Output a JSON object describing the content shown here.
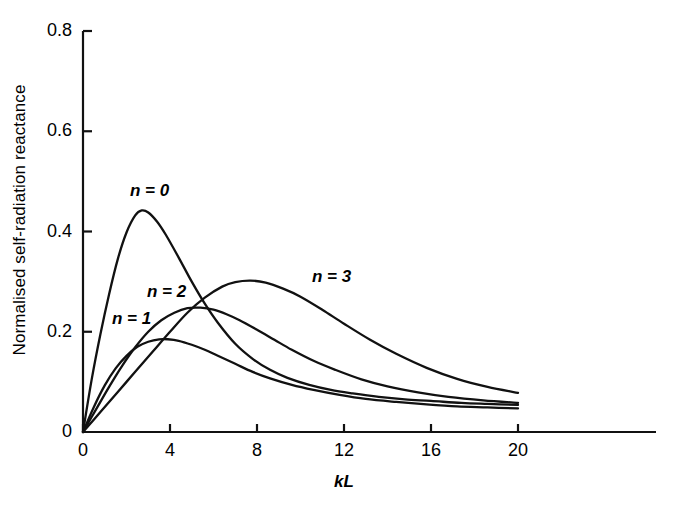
{
  "chart_data": {
    "type": "line",
    "title": "",
    "xlabel": "kL",
    "ylabel": "Normalised self-radiation reactance",
    "xlim": [
      0,
      26.3
    ],
    "ylim": [
      0,
      0.8
    ],
    "xticks": [
      0,
      4,
      8,
      12,
      16,
      20
    ],
    "xtick_labels": [
      "0",
      "4",
      "8",
      "12",
      "16",
      "20"
    ],
    "yticks": [
      0,
      0.2,
      0.4,
      0.6,
      0.8
    ],
    "ytick_labels": [
      "0",
      "0.2",
      "0.4",
      "0.6",
      "0.8"
    ],
    "grid": false,
    "legend": "inline-annotations",
    "line_color": "#111111",
    "background": "#ffffff",
    "series": [
      {
        "name": "n = 0",
        "label": "n = 0",
        "peak_x": 2.7,
        "peak_y": 0.442,
        "x": [
          0,
          0.4,
          0.8,
          1.2,
          1.6,
          2.0,
          2.4,
          2.7,
          3.0,
          3.4,
          3.8,
          4.4,
          5.0,
          5.6,
          6.2,
          7.0,
          7.8,
          8.6,
          9.4,
          10.4,
          11.4,
          12.4,
          13.6,
          14.8,
          16.0,
          17.4,
          18.6,
          20.0
        ],
        "y": [
          0.0,
          0.105,
          0.195,
          0.275,
          0.345,
          0.398,
          0.432,
          0.442,
          0.438,
          0.42,
          0.394,
          0.348,
          0.3,
          0.256,
          0.218,
          0.176,
          0.146,
          0.124,
          0.108,
          0.094,
          0.084,
          0.077,
          0.07,
          0.065,
          0.062,
          0.058,
          0.056,
          0.054
        ]
      },
      {
        "name": "n = 1",
        "label": "n = 1",
        "peak_x": 3.9,
        "peak_y": 0.185,
        "x": [
          0,
          0.5,
          1.0,
          1.5,
          2.0,
          2.5,
          3.0,
          3.5,
          3.9,
          4.4,
          5.0,
          5.6,
          6.2,
          7.0,
          7.8,
          8.6,
          9.6,
          10.6,
          11.8,
          13.0,
          14.4,
          15.8,
          17.2,
          18.6,
          20.0
        ],
        "y": [
          0.0,
          0.05,
          0.093,
          0.127,
          0.152,
          0.17,
          0.18,
          0.185,
          0.185,
          0.182,
          0.174,
          0.164,
          0.152,
          0.136,
          0.12,
          0.107,
          0.094,
          0.084,
          0.074,
          0.066,
          0.06,
          0.055,
          0.051,
          0.049,
          0.047
        ]
      },
      {
        "name": "n = 2",
        "label": "n = 2",
        "peak_x": 5.4,
        "peak_y": 0.248,
        "x": [
          0,
          0.6,
          1.2,
          1.8,
          2.4,
          3.0,
          3.6,
          4.2,
          4.8,
          5.4,
          6.0,
          6.6,
          7.2,
          8.0,
          8.8,
          9.6,
          10.6,
          11.6,
          12.8,
          14.0,
          15.4,
          16.8,
          18.4,
          20.0
        ],
        "y": [
          0.0,
          0.045,
          0.09,
          0.132,
          0.169,
          0.2,
          0.223,
          0.238,
          0.247,
          0.248,
          0.244,
          0.235,
          0.223,
          0.204,
          0.184,
          0.164,
          0.142,
          0.124,
          0.105,
          0.091,
          0.079,
          0.07,
          0.063,
          0.058
        ]
      },
      {
        "name": "n = 3",
        "label": "n = 3",
        "peak_x": 7.7,
        "peak_y": 0.302,
        "x": [
          0,
          0.8,
          1.6,
          2.4,
          3.2,
          4.0,
          4.8,
          5.6,
          6.4,
          7.0,
          7.7,
          8.4,
          9.2,
          10.0,
          11.0,
          12.0,
          13.2,
          14.4,
          15.8,
          17.2,
          18.6,
          20.0
        ],
        "y": [
          0.0,
          0.04,
          0.08,
          0.12,
          0.16,
          0.2,
          0.238,
          0.268,
          0.29,
          0.299,
          0.302,
          0.298,
          0.286,
          0.27,
          0.244,
          0.216,
          0.184,
          0.156,
          0.128,
          0.106,
          0.09,
          0.078
        ]
      }
    ],
    "annotations": [
      {
        "text": "n = 0",
        "x_px": 130,
        "y_px": 181
      },
      {
        "text": "n = 1",
        "x_px": 112,
        "y_px": 309
      },
      {
        "text": "n = 2",
        "x_px": 147,
        "y_px": 282
      },
      {
        "text": "n = 3",
        "x_px": 312,
        "y_px": 267
      }
    ]
  },
  "axes": {
    "x_label": "kL",
    "y_label": "Normalised self-radiation reactance"
  }
}
